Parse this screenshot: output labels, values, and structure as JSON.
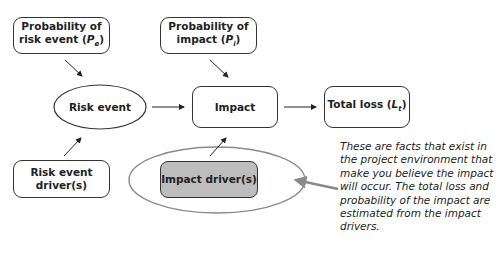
{
  "diagram": {
    "nodes": {
      "prob_risk_event": {
        "line1": "Probability of",
        "line2_prefix": "risk event (",
        "var": "P",
        "sub": "e",
        "suffix": ")"
      },
      "prob_impact": {
        "line1": "Probability of",
        "line2_prefix": "impact (",
        "var": "P",
        "sub": "i",
        "suffix": ")"
      },
      "risk_event": {
        "label": "Risk event"
      },
      "impact": {
        "label": "Impact"
      },
      "total_loss": {
        "prefix": "Total loss (",
        "var": "L",
        "sub": "t",
        "suffix": ")"
      },
      "risk_event_drivers": {
        "line1": "Risk event",
        "line2": "driver(s)"
      },
      "impact_drivers": {
        "label": "Impact driver(s)"
      }
    },
    "annotation": "These are facts that exist in the project environment that make you believe the impact will occur. The total loss and probability of the impact are estimated from the impact drivers.",
    "colors": {
      "shaded_fill": "#bdbdbd",
      "highlight_ellipse": "#8a8a8a",
      "callout_arrow": "#8a8a8a"
    }
  }
}
